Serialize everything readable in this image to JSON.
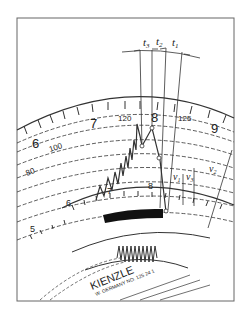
{
  "diagram": {
    "type": "tachograph-chart-detail",
    "hour_labels": [
      "5",
      "6",
      "7",
      "8",
      "9"
    ],
    "inner_hour_labels": [
      "6",
      "7",
      "8"
    ],
    "speed_labels": [
      "80",
      "100",
      "120",
      "125"
    ],
    "time_intervals": [
      "t3",
      "t2",
      "t1"
    ],
    "time_interval_display": {
      "t3": "t",
      "t3_sub": "3",
      "t2": "t",
      "t2_sub": "2",
      "t1": "t",
      "t1_sub": "1"
    },
    "speed_markers": {
      "v1": "v",
      "v1_sub": "1",
      "v3": "v",
      "v3_sub": "3",
      "v2": "v",
      "v2_sub": "2"
    },
    "brand": "KIENZLE",
    "imprint": "W. GERMANY NO. 125 24 1",
    "colors": {
      "ink": "#222222",
      "background": "#ffffff",
      "frame": "#555555"
    }
  }
}
